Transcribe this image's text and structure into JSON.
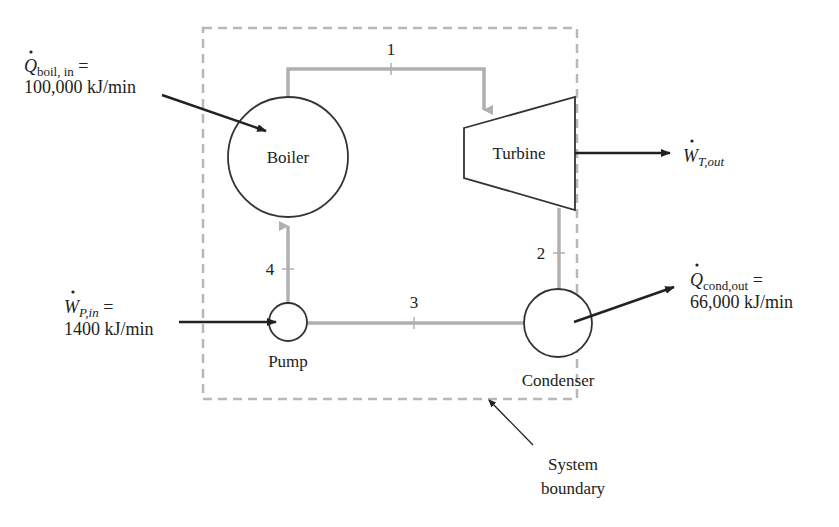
{
  "diagram": {
    "colors": {
      "pipe": "#b0b0b0",
      "boundary": "#b8b8b8",
      "component_stroke": "#333333",
      "arrow": "#222222",
      "text": "#222222"
    },
    "components": {
      "boiler": "Boiler",
      "turbine": "Turbine",
      "condenser": "Condenser",
      "pump": "Pump"
    },
    "states": {
      "s1": "1",
      "s2": "2",
      "s3": "3",
      "s4": "4"
    },
    "energy_flows": {
      "q_boil_in": {
        "symbol": "Q",
        "subscript": "boil, in",
        "equals": " =",
        "value": "100,000 kJ/min"
      },
      "w_turbine_out": {
        "symbol": "W",
        "subscript": "T,out"
      },
      "w_pump_in": {
        "symbol": "W",
        "subscript": "P,in",
        "equals": " =",
        "value": "1400 kJ/min"
      },
      "q_cond_out": {
        "symbol": "Q",
        "subscript": "cond,out",
        "equals": " =",
        "value": "66,000 kJ/min"
      }
    },
    "boundary_label": {
      "line1": "System",
      "line2": "boundary"
    }
  }
}
